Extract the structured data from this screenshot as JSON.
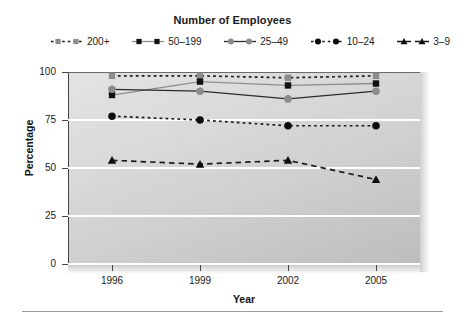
{
  "chart_data": {
    "type": "line",
    "title": "Number of Employees",
    "xlabel": "Year",
    "ylabel": "Percentage",
    "categories": [
      "1996",
      "1999",
      "2002",
      "2005"
    ],
    "x": [
      1996,
      1999,
      2002,
      2005
    ],
    "ylim": [
      0,
      100
    ],
    "yticks": [
      0,
      25,
      50,
      75,
      100
    ],
    "grid": true,
    "legend_position": "top",
    "series": [
      {
        "name": "200+",
        "values": [
          98,
          98,
          97,
          98
        ],
        "marker": "square",
        "marker_color": "#8c8c8c",
        "line_style": "dotted",
        "line_color": "#1a1a1a"
      },
      {
        "name": "50–199",
        "values": [
          88,
          95,
          93,
          94
        ],
        "marker": "square",
        "marker_color": "#111111",
        "line_style": "solid",
        "line_color": "#8e8e8e"
      },
      {
        "name": "25–49",
        "values": [
          91,
          90,
          86,
          90
        ],
        "marker": "circle",
        "marker_color": "#8c8c8c",
        "line_style": "solid",
        "line_color": "#2b2b2b"
      },
      {
        "name": "10–24",
        "values": [
          77,
          75,
          72,
          72
        ],
        "marker": "circle",
        "marker_color": "#0d0d0d",
        "line_style": "dotted",
        "line_color": "#1a1a1a"
      },
      {
        "name": "3–9",
        "values": [
          54,
          52,
          54,
          44
        ],
        "marker": "triangle",
        "marker_color": "#0d0d0d",
        "line_style": "dashed",
        "line_color": "#1a1a1a"
      }
    ]
  },
  "legend": {
    "title": "Number of Employees",
    "items": [
      {
        "label": "200+"
      },
      {
        "label": "50–199"
      },
      {
        "label": "25–49"
      },
      {
        "label": "10–24"
      },
      {
        "label": "3–9"
      }
    ]
  },
  "axes": {
    "y_title": "Percentage",
    "x_title": "Year",
    "y_tick_labels": [
      "100",
      "75",
      "50",
      "25",
      "0"
    ],
    "x_tick_labels": [
      "1996",
      "1999",
      "2002",
      "2005"
    ]
  }
}
